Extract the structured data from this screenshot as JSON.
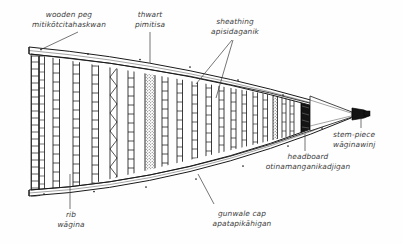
{
  "figure": {
    "type": "technical line drawing",
    "background_color": "#fefefe",
    "line_color": "#1a1a1a",
    "text_color": "#3b3b3b"
  },
  "labels": [
    {
      "id": "wooden-peg",
      "english": "wooden peg",
      "native": "mitikōtcitahaskwan",
      "position": "top-left",
      "leader": "diagonal down-right to gunwale peg"
    },
    {
      "id": "thwart",
      "english": "thwart",
      "native": "pimitisa",
      "position": "top-center",
      "leader": "vertical down to stippled thwart band"
    },
    {
      "id": "sheathing",
      "english": "sheathing",
      "native": "apisidaganik",
      "position": "top-right",
      "leader": "two lines fanning down-left to hull planking"
    },
    {
      "id": "rib",
      "english": "rib",
      "native": "wāgina",
      "position": "bottom-left",
      "leader": "vertical up to a rib member"
    },
    {
      "id": "gunwale-cap",
      "english": "gunwale cap",
      "native": "apatapikāhigan",
      "position": "bottom-center",
      "leader": "diagonal up-right to lower gunwale rail"
    },
    {
      "id": "headboard",
      "english": "headboard",
      "native": "otinamanganikadjigan",
      "position": "bottom-right",
      "leader": "vertical up to dark headboard block"
    },
    {
      "id": "stem-piece",
      "english": "stem-piece",
      "native": "wāginawinj",
      "position": "right",
      "leader": "vertical up to dark stem block at bow tip"
    }
  ],
  "structure": {
    "hull_outline": "elongated wedge tapering left-to-right to a point at the bow",
    "gunwale_rails": 2,
    "rib_count": 17,
    "peg_dots_on_gunwale": 9,
    "rib_patterns": [
      "ladder",
      "zigzag",
      "stipple"
    ],
    "dark_elements": [
      "headboard",
      "stem-piece"
    ]
  }
}
